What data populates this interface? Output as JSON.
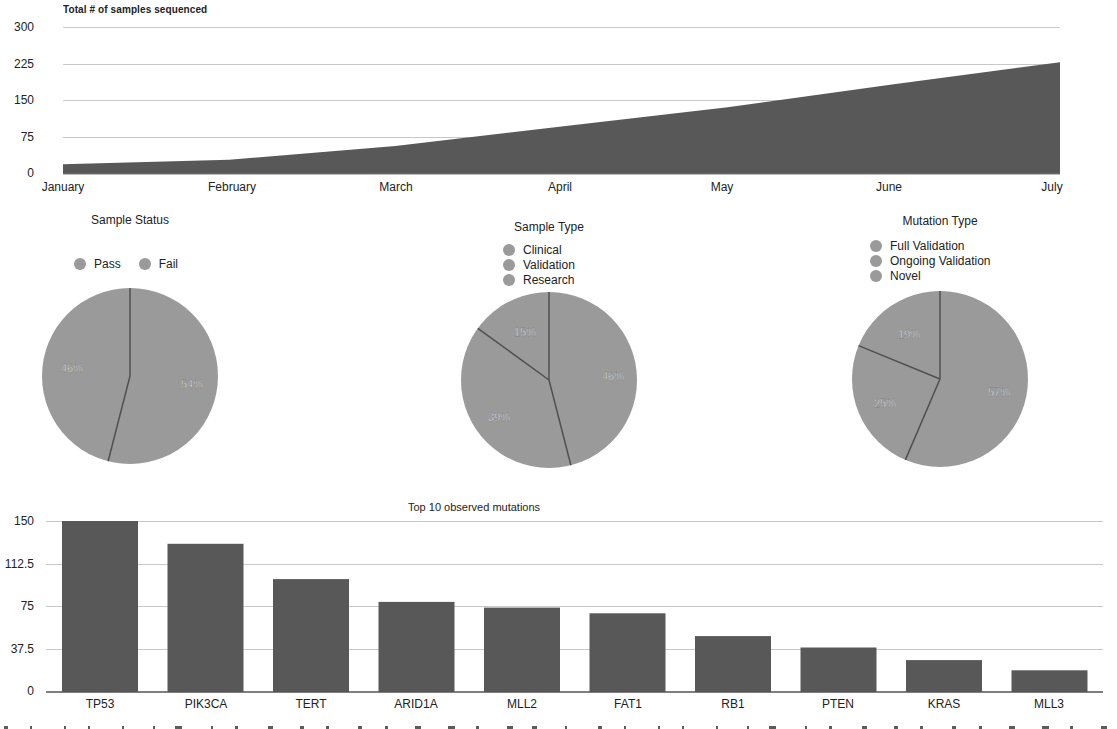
{
  "colors": {
    "dark_fill": "#585858",
    "pie_fill": "#9a9a9a",
    "pie_separator": "#505050",
    "grid": "#c8c8c8",
    "text": "#222222"
  },
  "area_chart": {
    "title": "Total # of samples sequenced",
    "y_ticks": [
      "300",
      "225",
      "150",
      "75",
      "0"
    ],
    "x_ticks": [
      "January",
      "February",
      "March",
      "April",
      "May",
      "June",
      "July"
    ]
  },
  "pie_status": {
    "title": "Sample Status",
    "legend": [
      "Pass",
      "Fail"
    ],
    "labels": [
      "54%",
      "46%"
    ]
  },
  "pie_type": {
    "title": "Sample Type",
    "legend": [
      "Clinical",
      "Validation",
      "Research"
    ],
    "labels": [
      "46%",
      "39%",
      "15%"
    ]
  },
  "pie_mutation": {
    "title": "Mutation Type",
    "legend": [
      "Full Validation",
      "Ongoing Validation",
      "Novel"
    ],
    "labels": [
      "57%",
      "25%",
      "19%"
    ]
  },
  "bar_chart": {
    "title": "Top 10 observed mutations",
    "y_ticks": [
      "150",
      "112.5",
      "75",
      "37.5",
      "0"
    ],
    "categories": [
      "TP53",
      "PIK3CA",
      "TERT",
      "ARID1A",
      "MLL2",
      "FAT1",
      "RB1",
      "PTEN",
      "KRAS",
      "MLL3"
    ]
  },
  "chart_data": [
    {
      "type": "area",
      "title": "Total # of samples sequenced",
      "categories": [
        "January",
        "February",
        "March",
        "April",
        "May",
        "June",
        "July"
      ],
      "values": [
        20,
        29,
        57,
        97,
        136,
        183,
        228
      ],
      "xlabel": "",
      "ylabel": "",
      "ylim": [
        0,
        300
      ],
      "yticks": [
        0,
        75,
        150,
        225,
        300
      ],
      "grid": true,
      "legend": "none"
    },
    {
      "type": "pie",
      "title": "Sample Status",
      "categories": [
        "Pass",
        "Fail"
      ],
      "values": [
        54,
        46
      ],
      "legend": "top"
    },
    {
      "type": "pie",
      "title": "Sample Type",
      "categories": [
        "Clinical",
        "Validation",
        "Research"
      ],
      "values": [
        46,
        39,
        15
      ],
      "legend": "top"
    },
    {
      "type": "pie",
      "title": "Mutation Type",
      "categories": [
        "Full Validation",
        "Ongoing Validation",
        "Novel"
      ],
      "values": [
        57,
        25,
        19
      ],
      "legend": "top"
    },
    {
      "type": "bar",
      "title": "Top 10 observed mutations",
      "categories": [
        "TP53",
        "PIK3CA",
        "TERT",
        "ARID1A",
        "MLL2",
        "FAT1",
        "RB1",
        "PTEN",
        "KRAS",
        "MLL3"
      ],
      "values": [
        150,
        130,
        99,
        79,
        74,
        69,
        49,
        39,
        28,
        19
      ],
      "xlabel": "",
      "ylabel": "",
      "ylim": [
        0,
        150
      ],
      "yticks": [
        0,
        37.5,
        75,
        112.5,
        150
      ],
      "grid": true,
      "legend": "none"
    }
  ]
}
